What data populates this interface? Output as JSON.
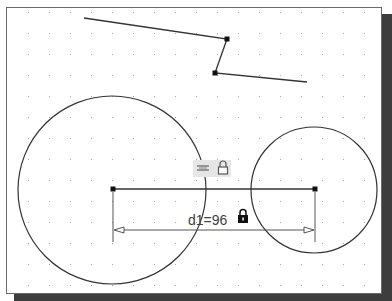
{
  "sketch": {
    "grid": {
      "spacing": 21,
      "origin_x": 28,
      "origin_y": 12,
      "dot_color": "#a8a8a8"
    },
    "colors": {
      "line": "#333333",
      "background": "#ffffff",
      "shadow": "#3d3d3d",
      "frame": "#6a6a6a"
    },
    "polyline": {
      "points": [
        [
          84,
          18
        ],
        [
          227,
          39
        ],
        [
          215,
          73
        ],
        [
          307,
          82
        ]
      ],
      "vertices_marked": [
        [
          227,
          39
        ],
        [
          215,
          73
        ]
      ]
    },
    "circles": [
      {
        "id": "circle-large",
        "cx": 112,
        "cy": 190,
        "r": 94
      },
      {
        "id": "circle-small",
        "cx": 314,
        "cy": 190,
        "r": 63
      }
    ],
    "center_line": {
      "x1": 113,
      "y1": 189,
      "x2": 315,
      "y2": 189
    },
    "dimension": {
      "name": "d1",
      "value": "96",
      "label": "d1=96",
      "locked": true,
      "arrow_y": 230,
      "ext_x1": 113,
      "ext_x2": 315
    },
    "constraint_badge": {
      "icons": [
        "horizontal-constraint-icon",
        "lock-icon"
      ]
    }
  }
}
